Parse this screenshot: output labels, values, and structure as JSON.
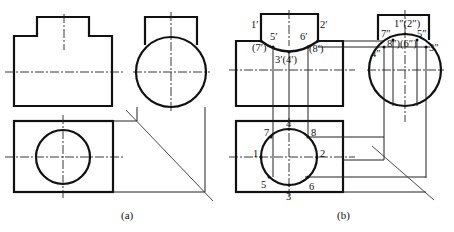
{
  "figure_a": {
    "caption": "(a)",
    "views": [
      "front-view",
      "side-view",
      "top-view"
    ]
  },
  "figure_b": {
    "caption": "(b)",
    "front_labels": {
      "p1": "1′",
      "p2": "2′",
      "p5": "5′",
      "p6": "6′",
      "p7": "(7′)",
      "p8": "(8′)",
      "p34": "3′(4′)"
    },
    "side_labels": {
      "p12": "1″(2″)",
      "p7": "7″",
      "p5": "5″",
      "p4": "4″",
      "p3": "3″",
      "p86": "8″)(6″)"
    },
    "top_labels": {
      "p1": "1",
      "p2": "2",
      "p3": "3",
      "p4": "4",
      "p5": "5",
      "p6": "6",
      "p7": "7",
      "p8": "8"
    }
  },
  "colors": {
    "line": "#111111",
    "background": "#ffffff"
  }
}
